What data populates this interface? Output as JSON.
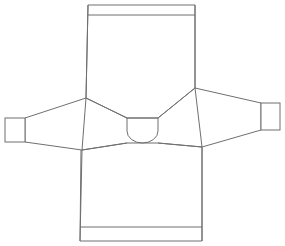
{
  "figure": {
    "view": "flat front view",
    "caption": "",
    "background_color": "#ffffff",
    "line_color": "#6f6f6f",
    "line_width": 1,
    "fill_color": "#ffffff",
    "canvas": {
      "width": 285,
      "height": 246
    }
  },
  "parts": [
    {
      "id": "upper-body-panel",
      "label": "Upper body panel",
      "description": "Large rectangular yoke panel at top of flat, tapering to raglan shoulder points",
      "points": "88,5 195,5 195,88 158,118 127,118 86,98",
      "stroke": "#6f6f6f"
    },
    {
      "id": "lower-body-panel",
      "label": "Lower body panel",
      "description": "Body front/back below the raglan seams ending at hem band",
      "points": "82,150 127,143 158,143 202,147 202,241 80,241",
      "stroke": "#6f6f6f"
    },
    {
      "id": "left-sleeve-panel",
      "label": "Left sleeve",
      "description": "Tapered sleeve extending left from shoulder point to cuff",
      "points": "86,98 25,118 25,142 82,150",
      "stroke": "#6f6f6f"
    },
    {
      "id": "right-sleeve-panel",
      "label": "Right sleeve",
      "description": "Tapered sleeve extending right from shoulder point to cuff",
      "points": "195,88 261,103 261,130 202,147",
      "stroke": "#6f6f6f"
    },
    {
      "id": "left-cuff",
      "label": "Left cuff",
      "description": "Rectangular ribbed cuff at end of left sleeve",
      "x": 5,
      "y": 118,
      "width": 20,
      "height": 24,
      "stroke": "#6f6f6f"
    },
    {
      "id": "right-cuff",
      "label": "Right cuff",
      "description": "Rectangular ribbed cuff at end of right sleeve",
      "x": 261,
      "y": 103,
      "width": 19,
      "height": 27,
      "stroke": "#6f6f6f"
    },
    {
      "id": "neck-opening",
      "label": "Neck opening",
      "description": "Rounded U-shaped neckline at centre of flat",
      "path": "M 127,118 L 127,131 A 15.5 12 0 0 0 158,131 L 158,118",
      "stroke": "#6f6f6f"
    }
  ],
  "detail_lines": [
    {
      "id": "top-hem-line",
      "label": "Top hem / welt line",
      "description": "Horizontal stitch line across top of upper body panel",
      "x1": 88,
      "y1": 15,
      "x2": 195,
      "y2": 15,
      "stroke": "#6f6f6f"
    },
    {
      "id": "bottom-hem-line",
      "label": "Bottom hem / waistband line",
      "description": "Horizontal stitch line above bottom edge of lower body panel",
      "x1": 80,
      "y1": 227,
      "x2": 202,
      "y2": 227,
      "stroke": "#6f6f6f"
    },
    {
      "id": "left-raglan-seam-upper",
      "label": "Left upper raglan seam",
      "description": "Diagonal seam from left shoulder point down to neck left corner",
      "x1": 86,
      "y1": 98,
      "x2": 127,
      "y2": 118,
      "stroke": "#6f6f6f"
    },
    {
      "id": "right-raglan-seam-upper",
      "label": "Right upper raglan seam",
      "description": "Diagonal seam from right shoulder point down to neck right corner",
      "x1": 195,
      "y1": 88,
      "x2": 158,
      "y2": 118,
      "stroke": "#6f6f6f"
    },
    {
      "id": "left-raglan-seam-lower",
      "label": "Left lower raglan seam",
      "description": "Diagonal seam from neck left base out to left armpit point",
      "x1": 127,
      "y1": 143,
      "x2": 82,
      "y2": 150,
      "stroke": "#6f6f6f"
    },
    {
      "id": "right-raglan-seam-lower",
      "label": "Right lower raglan seam",
      "description": "Diagonal seam from neck right base out to right armpit point",
      "x1": 158,
      "y1": 143,
      "x2": 202,
      "y2": 147,
      "stroke": "#6f6f6f"
    },
    {
      "id": "left-body-side-seam",
      "label": "Left body side seam",
      "description": "Vertical side seam of lower body from armpit to hem",
      "x1": 81,
      "y1": 150,
      "x2": 80,
      "y2": 241,
      "stroke": "#6f6f6f"
    },
    {
      "id": "right-body-side-seam",
      "label": "Right body side seam",
      "description": "Vertical side seam of lower body from armpit to hem",
      "x1": 202,
      "y1": 147,
      "x2": 202,
      "y2": 241,
      "stroke": "#6f6f6f"
    },
    {
      "id": "left-upper-panel-edge",
      "label": "Left upper panel edge",
      "description": "Vertical left edge of upper body panel",
      "x1": 88,
      "y1": 5,
      "x2": 86,
      "y2": 98,
      "stroke": "#6f6f6f"
    },
    {
      "id": "right-upper-panel-edge",
      "label": "Right upper panel edge",
      "description": "Vertical right edge of upper body panel",
      "x1": 195,
      "y1": 5,
      "x2": 195,
      "y2": 88,
      "stroke": "#6f6f6f"
    }
  ]
}
